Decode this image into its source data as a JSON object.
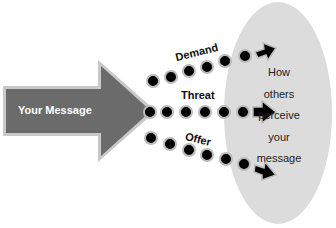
{
  "source": {
    "label": "Your Message",
    "color": "#6b6b6b"
  },
  "paths": [
    {
      "label": "Demand"
    },
    {
      "label": "Threat"
    },
    {
      "label": "Offer"
    }
  ],
  "target": {
    "lines": [
      "How",
      "others",
      "perceive",
      "your",
      "message"
    ],
    "color": "#dcdcdc"
  }
}
